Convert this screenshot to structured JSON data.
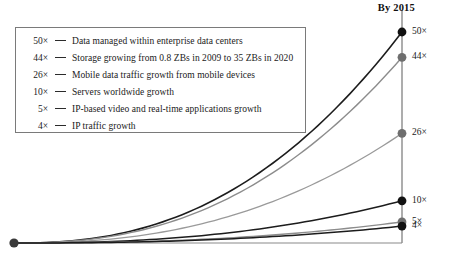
{
  "chart": {
    "title": "By 2015",
    "axis_color": "#8a8a8a",
    "baseline_color": "#8a8a8a"
  },
  "legend": {
    "items": [
      {
        "value": "50×",
        "label": "Data managed within enterprise data centers"
      },
      {
        "value": "44×",
        "label": "Storage growing from 0.8 ZBs in 2009 to 35 ZBs in 2020"
      },
      {
        "value": "26×",
        "label": "Mobile data traffic growth from mobile devices"
      },
      {
        "value": "10×",
        "label": "Servers worldwide growth"
      },
      {
        "value": "5×",
        "label": "IP-based video and real-time applications growth"
      },
      {
        "value": "4×",
        "label": "IP traffic growth"
      }
    ]
  },
  "endpoints": [
    {
      "label": "50×"
    },
    {
      "label": "44×"
    },
    {
      "label": "26×"
    },
    {
      "label": "10×"
    },
    {
      "label": "5×"
    },
    {
      "label": "4×"
    }
  ],
  "chart_data": {
    "type": "line",
    "title": "By 2015",
    "xlabel": "",
    "ylabel": "",
    "x": [
      2010,
      2015
    ],
    "xlim": [
      2010,
      2015
    ],
    "ylim": [
      0,
      50
    ],
    "grid": false,
    "legend_position": "top-left",
    "annotations": [
      "By 2015"
    ],
    "note": "Exponential growth curves all originating from a common origin point at the lower left and terminating at labelled multiples on the right-hand axis.",
    "series": [
      {
        "name": "Data managed within enterprise data centers",
        "end_value": 50,
        "end_label": "50×",
        "color": "#1c1c1c",
        "width": 1.6
      },
      {
        "name": "Storage growing from 0.8 ZBs in 2009 to 35 ZBs in 2020",
        "end_value": 44,
        "end_label": "44×",
        "color": "#8c8c8c",
        "width": 1.4
      },
      {
        "name": "Mobile data traffic growth from mobile devices",
        "end_value": 26,
        "end_label": "26×",
        "color": "#9a9a9a",
        "width": 1.3
      },
      {
        "name": "Servers worldwide growth",
        "end_value": 10,
        "end_label": "10×",
        "color": "#1c1c1c",
        "width": 1.5
      },
      {
        "name": "IP-based video and real-time applications growth",
        "end_value": 5,
        "end_label": "5×",
        "color": "#8c8c8c",
        "width": 1.4
      },
      {
        "name": "IP traffic growth",
        "end_value": 4,
        "end_label": "4×",
        "color": "#1c1c1c",
        "width": 1.5
      }
    ]
  }
}
